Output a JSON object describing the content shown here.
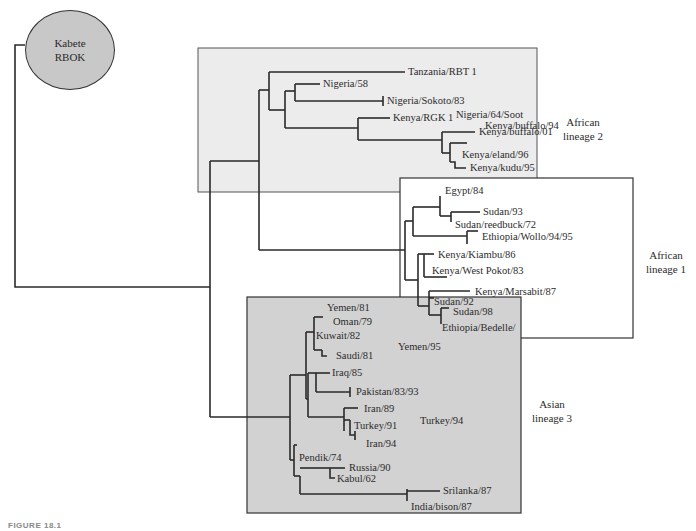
{
  "root": {
    "line1": "Kabete",
    "line2": "RBOK"
  },
  "groups": {
    "african2": {
      "line1": "African",
      "line2": "lineage 2",
      "fill": "#ececec"
    },
    "african1": {
      "line1": "African",
      "line2": "lineage 1",
      "fill": "#ffffff"
    },
    "asian3": {
      "line1": "Asian",
      "line2": "lineage 3",
      "fill": "#d2d2d2"
    }
  },
  "taxa": {
    "t0": "Tanzania/RBT 1",
    "t1": "Nigeria/58",
    "t2": "Nigeria/Sokoto/83",
    "t3": "Nigeria/64/Soot",
    "t4": "Kenya/RGK 1",
    "t5": "Kenya/buffalo/94",
    "t6": "Kenya/buffalo/01",
    "t7": "Kenya/eland/96",
    "t8": "Kenya/kudu/95",
    "t9": "Egypt/84",
    "t10": "Sudan/93",
    "t11": "Sudan/reedbuck/72",
    "t12": "Ethiopia/Wollo/94/95",
    "t13": "Kenya/Kiambu/86",
    "t14": "Kenya/West Pokot/83",
    "t15": "Kenya/Marsabit/87",
    "t16": "Sudan/92",
    "t17": "Sudan/98",
    "t18": "Ethiopia/Bedelle/",
    "t19": "Yemen/81",
    "t20": "Oman/79",
    "t21": "Kuwait/82",
    "t22": "Yemen/95",
    "t23": "Saudi/81",
    "t24": "Iraq/85",
    "t25": "Pakistan/83/93",
    "t26": "Iran/89",
    "t27": "Turkey/94",
    "t28": "Turkey/91",
    "t29": "Iran/94",
    "t30": "Pendik/74",
    "t31": "Russia/90",
    "t32": "Kabul/62",
    "t33": "Srilanka/87",
    "t34": "India/bison/87"
  },
  "caption": "FIGURE 18.1"
}
